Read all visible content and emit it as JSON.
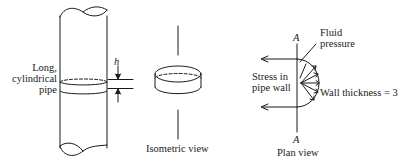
{
  "figure": {
    "pipe": {
      "label_line1": "Long,",
      "label_line2": "cylindrical",
      "label_line3": "pipe",
      "height_symbol": "h"
    },
    "isometric": {
      "caption": "Isometric view"
    },
    "plan": {
      "section_top": "A",
      "section_bottom": "A",
      "fluid_line1": "Fluid",
      "fluid_line2": "pressure",
      "stress_line1": "Stress in",
      "stress_line2": "pipe wall",
      "wall_thickness": "Wall thickness = 3",
      "caption": "Plan view"
    },
    "colors": {
      "ink": "#1a1a1a",
      "background": "#ffffff"
    }
  }
}
